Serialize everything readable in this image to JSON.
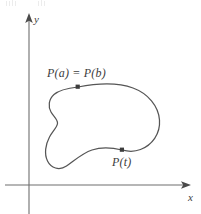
{
  "figure": {
    "type": "math-diagram",
    "background_color": "#ffffff",
    "curve_color": "#555555",
    "axis_color": "#6e6e6e",
    "text_color": "#3d3d3d",
    "axes": {
      "x_label": "x",
      "y_label": "y",
      "origin": {
        "x": 29,
        "y": 185
      },
      "x_axis": {
        "start_x": 5,
        "end_x": 191,
        "y": 185,
        "arrow": "right"
      },
      "y_axis": {
        "x": 29,
        "start_y": 214,
        "end_y": 14,
        "arrow": "up"
      }
    },
    "labels": [
      {
        "id": "pab",
        "text": "P(a) = P(b)",
        "x": 47,
        "y": 67
      },
      {
        "id": "pt",
        "text": "P(t)",
        "x": 112,
        "y": 156
      }
    ],
    "points": [
      {
        "id": "pab",
        "label": "P(a) = P(b)",
        "x": 78,
        "y": 87
      },
      {
        "id": "pt",
        "label": "P(t)",
        "x": 122,
        "y": 150
      }
    ],
    "curve_path": "M 78 87 C 104 82 131 84 146 99 C 160 113 162 132 151 145 C 140 158 124 151 122 150 C 108 147 95 148 85 155 C 74 163 66 169 58 165 C 49 161 44 150 44 140 C 44 131 49 124 53 120 C 57 116 55 112 52 108 C 48 103 50 96 56 92 C 62 88 70 88 78 87 Z"
  }
}
